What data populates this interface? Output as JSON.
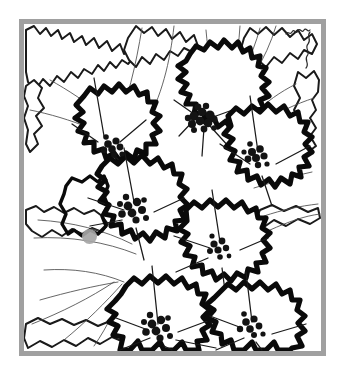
{
  "artwork": {
    "title": "Dogwood Blossoms",
    "style": "black-and-white woodcut line art",
    "medium": "ink illustration",
    "caption": "",
    "canvas": {
      "width": 343,
      "height": 378,
      "background_color": "#ffffff"
    },
    "frame": {
      "name": "picture-frame-border",
      "color": "#a0a0a0",
      "thickness_px": 5,
      "x": 19,
      "y": 19,
      "width": 307,
      "height": 337,
      "fill_color": "#ffffff"
    },
    "ink_color": "#0a0a0a",
    "vein_color": "#4a4a4a",
    "flowers": [
      {
        "id": "flower-top-center",
        "cx": 186,
        "cy": 108,
        "center_r": 13,
        "petals": 4,
        "label": "Blossom 1"
      },
      {
        "id": "flower-upper-left",
        "cx": 100,
        "cy": 141,
        "center_r": 10,
        "petals": 4,
        "label": "Blossom 2"
      },
      {
        "id": "flower-right",
        "cx": 258,
        "cy": 167,
        "center_r": 11,
        "petals": 4,
        "label": "Blossom 3"
      },
      {
        "id": "flower-center-left",
        "cx": 143,
        "cy": 230,
        "center_r": 12,
        "petals": 4,
        "label": "Blossom 4"
      },
      {
        "id": "flower-center-right",
        "cx": 222,
        "cy": 248,
        "center_r": 9,
        "petals": 4,
        "label": "Blossom 5"
      },
      {
        "id": "flower-bottom-center",
        "cx": 173,
        "cy": 330,
        "center_r": 12,
        "petals": 4,
        "label": "Blossom 6"
      },
      {
        "id": "flower-bottom-right",
        "cx": 264,
        "cy": 327,
        "center_r": 10,
        "petals": 4,
        "label": "Blossom 7"
      }
    ],
    "cursor": {
      "name": "cursor-dot",
      "color": "#a6a6a6",
      "x": 89,
      "y": 236,
      "radius": 7.5
    },
    "signature_mark": {
      "name": "corner-scribble",
      "x": 289,
      "y": 25,
      "text": ""
    }
  }
}
